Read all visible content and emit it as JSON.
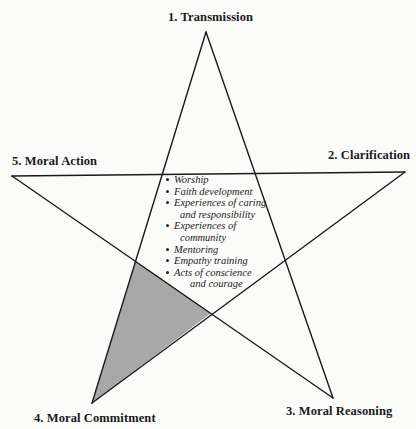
{
  "diagram": {
    "type": "five-point star",
    "vertices": [
      {
        "id": 1,
        "label": "1. Transmission",
        "position": "top"
      },
      {
        "id": 2,
        "label": "2. Clarification",
        "position": "right"
      },
      {
        "id": 3,
        "label": "3. Moral Reasoning",
        "position": "bottom-right"
      },
      {
        "id": 4,
        "label": "4. Moral Commitment",
        "position": "bottom-left"
      },
      {
        "id": 5,
        "label": "5. Moral Action",
        "position": "left"
      }
    ],
    "center_list": [
      {
        "line1": "Worship"
      },
      {
        "line1": "Faith development"
      },
      {
        "line1": "Experiences of caring",
        "line2": "and responsibility"
      },
      {
        "line1": "Experiences of",
        "line2": "community"
      },
      {
        "line1": "Mentoring"
      },
      {
        "line1": "Empathy training"
      },
      {
        "line1": "Acts of conscience",
        "line2": "and courage"
      }
    ],
    "highlighted_region": "point 4 (Moral Commitment)",
    "colors": {
      "stroke": "#1a1a1a",
      "shade": "#a8a8a8",
      "background": "#fbfbfa"
    }
  }
}
